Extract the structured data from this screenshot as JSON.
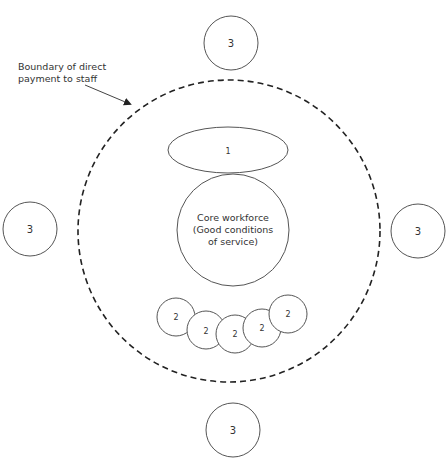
{
  "annotation": {
    "line1": "Boundary of direct",
    "line2": "payment to staff"
  },
  "core": {
    "line1": "Core workforce",
    "line2": "(Good conditions",
    "line3": "of service)"
  },
  "ellipse_label": "1",
  "small_circles": [
    "2",
    "2",
    "2",
    "2",
    "2"
  ],
  "outer_circles": {
    "top": "3",
    "left": "3",
    "right": "3",
    "bottom": "3"
  },
  "colors": {
    "stroke": "#555555",
    "dashed": "#222222",
    "text": "#333333"
  }
}
